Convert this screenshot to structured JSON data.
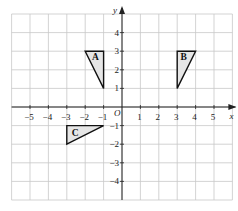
{
  "diagram": {
    "type": "coordinate-grid",
    "axes": {
      "x_label": "x",
      "y_label": "y",
      "origin_label": "O",
      "x_range": [
        -6,
        6
      ],
      "y_range": [
        -5,
        5
      ],
      "x_ticks": [
        "-5",
        "-4",
        "-3",
        "-2",
        "-1",
        "1",
        "2",
        "3",
        "4",
        "5"
      ],
      "y_ticks": [
        "4",
        "3",
        "2",
        "1",
        "-1",
        "-2",
        "-3",
        "-4"
      ]
    },
    "shapes": [
      {
        "label": "A",
        "vertices": [
          [
            -2,
            3
          ],
          [
            -1,
            3
          ],
          [
            -1,
            1
          ]
        ],
        "fill": "#e6e6e6"
      },
      {
        "label": "B",
        "vertices": [
          [
            3,
            3
          ],
          [
            4,
            3
          ],
          [
            3,
            1
          ]
        ],
        "fill": "#e6e6e6"
      },
      {
        "label": "C",
        "vertices": [
          [
            -3,
            -1
          ],
          [
            -1,
            -1
          ],
          [
            -3,
            -2
          ]
        ],
        "fill": "#e6e6e6"
      }
    ],
    "colors": {
      "grid": "#c8c8c8",
      "axis": "#222222",
      "outline": "#111111"
    }
  }
}
